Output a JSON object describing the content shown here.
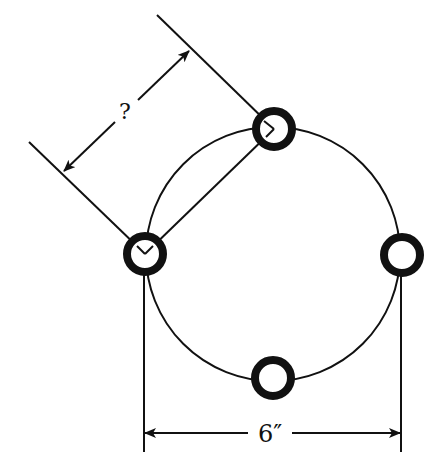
{
  "diagram": {
    "circle": {
      "cx": 273,
      "cy": 254,
      "r": 127
    },
    "holes": [
      {
        "id": "top",
        "cx": 274,
        "cy": 129
      },
      {
        "id": "left",
        "cx": 145,
        "cy": 254
      },
      {
        "id": "right",
        "cx": 402,
        "cy": 255
      },
      {
        "id": "bottom",
        "cx": 273,
        "cy": 378
      }
    ],
    "hole_style": {
      "outer_r": 19,
      "stroke_width": 8
    },
    "labels": {
      "unknown_dimension": "?",
      "diameter_dimension": "6″"
    },
    "colors": {
      "ink": "#111111",
      "background": "#ffffff"
    }
  }
}
